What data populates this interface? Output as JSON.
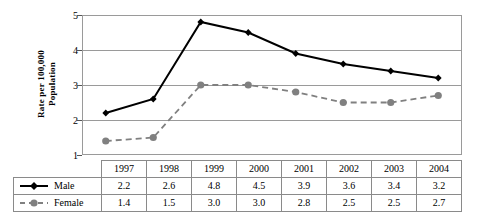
{
  "chart_data": {
    "type": "line",
    "title": "",
    "xlabel": "",
    "ylabel": "Rate per 100,000 Population",
    "ylabel_line1": "Rate per 100,000",
    "ylabel_line2": "Population",
    "ylim": [
      1,
      5
    ],
    "yticks": [
      1,
      2,
      3,
      4,
      5
    ],
    "ytick_labels": [
      "1",
      "2",
      "3",
      "4",
      "5"
    ],
    "grid": true,
    "grid_axis": "y",
    "legend_position": "table-left-column",
    "categories": [
      "1997",
      "1998",
      "1999",
      "2000",
      "2001",
      "2002",
      "2003",
      "2004"
    ],
    "series": [
      {
        "name": "Male",
        "values": [
          2.2,
          2.6,
          4.8,
          4.5,
          3.9,
          3.6,
          3.4,
          3.2
        ],
        "color": "#000000",
        "linestyle": "solid",
        "marker": "diamond"
      },
      {
        "name": "Female",
        "values": [
          1.4,
          1.5,
          3.0,
          3.0,
          2.8,
          2.5,
          2.5,
          2.7
        ],
        "color": "#808080",
        "linestyle": "dashed",
        "marker": "circle"
      }
    ]
  },
  "table": {
    "header_blank": "",
    "year_headers": [
      "1997",
      "1998",
      "1999",
      "2000",
      "2001",
      "2002",
      "2003",
      "2004"
    ],
    "rows": [
      {
        "label": "Male",
        "values": [
          "2.2",
          "2.6",
          "4.8",
          "4.5",
          "3.9",
          "3.6",
          "3.4",
          "3.2"
        ]
      },
      {
        "label": "Female",
        "values": [
          "1.4",
          "1.5",
          "3.0",
          "3.0",
          "2.8",
          "2.5",
          "2.5",
          "2.7"
        ]
      }
    ]
  },
  "colors": {
    "male": "#000000",
    "female": "#808080",
    "grid": "#9a9a9a",
    "border": "#8a8a8a"
  }
}
